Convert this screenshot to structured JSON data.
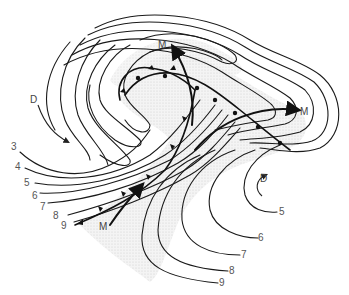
{
  "diagram": {
    "colors": {
      "line": "#1a1a1a",
      "shade": "#e4e4e4",
      "label": "#555555"
    },
    "labels": {
      "low_center_left": "D",
      "low_center_right": "D",
      "stream_top": "M",
      "stream_right": "M",
      "stream_bottom": "M"
    },
    "isobar_labels_left": [
      "3",
      "4",
      "5",
      "6",
      "7",
      "8",
      "9"
    ],
    "isobar_labels_right": [
      "5",
      "6",
      "7",
      "8",
      "9"
    ]
  }
}
